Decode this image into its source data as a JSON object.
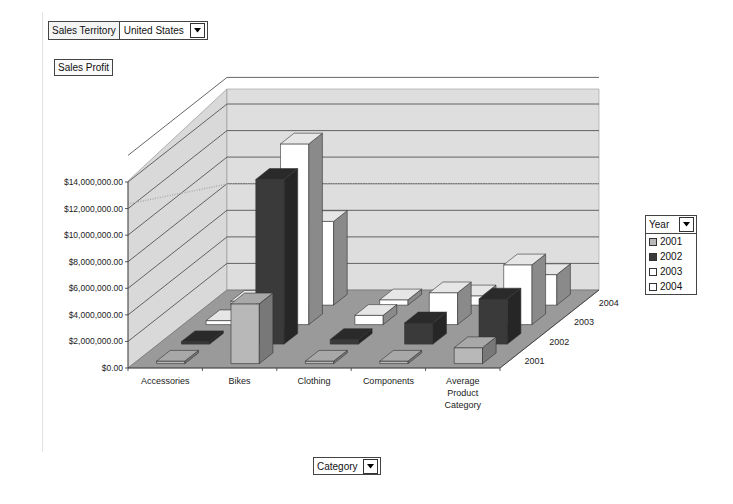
{
  "filters": {
    "sales_territory": {
      "label": "Sales Territory",
      "value": "United States"
    }
  },
  "measure": {
    "label": "Sales Profit"
  },
  "legend": {
    "title": "Year",
    "items": [
      {
        "label": "2001",
        "color": "#b8b8b8"
      },
      {
        "label": "2002",
        "color": "#3a3a3a"
      },
      {
        "label": "2003",
        "color": "#ffffff"
      },
      {
        "label": "2004",
        "color": "#ffffff"
      }
    ]
  },
  "category_selector": {
    "label": "Category"
  },
  "chart_data": {
    "type": "bar",
    "subtype": "3d-column",
    "title": "Sales Profit",
    "xlabel": "Category",
    "ylabel": "Sales Profit",
    "zlabel": "Year",
    "categories": [
      "Accessories",
      "Bikes",
      "Clothing",
      "Components",
      "Average Product Category"
    ],
    "category_labels": [
      [
        "Accessories"
      ],
      [
        "Bikes"
      ],
      [
        "Clothing"
      ],
      [
        "Components"
      ],
      [
        "Average",
        "Product",
        "Category"
      ]
    ],
    "y_ticks": [
      "$0.00",
      "$2,000,000.00",
      "$4,000,000.00",
      "$6,000,000.00",
      "$8,000,000.00",
      "$10,000,000.00",
      "$12,000,000.00",
      "$14,000,000.00"
    ],
    "ylim": [
      0,
      14000000
    ],
    "series": [
      {
        "name": "2001",
        "color": "#b8b8b8",
        "values": [
          50000,
          4500000,
          50000,
          100000,
          1200000
        ]
      },
      {
        "name": "2002",
        "color": "#3a3a3a",
        "values": [
          100000,
          12400000,
          350000,
          1600000,
          3400000
        ]
      },
      {
        "name": "2003",
        "color": "#ffffff",
        "values": [
          300000,
          13600000,
          700000,
          2400000,
          4500000
        ]
      },
      {
        "name": "2004",
        "color": "#ffffff",
        "values": [
          300000,
          6300000,
          400000,
          700000,
          2300000
        ]
      }
    ],
    "grid": true,
    "legend_position": "right"
  }
}
